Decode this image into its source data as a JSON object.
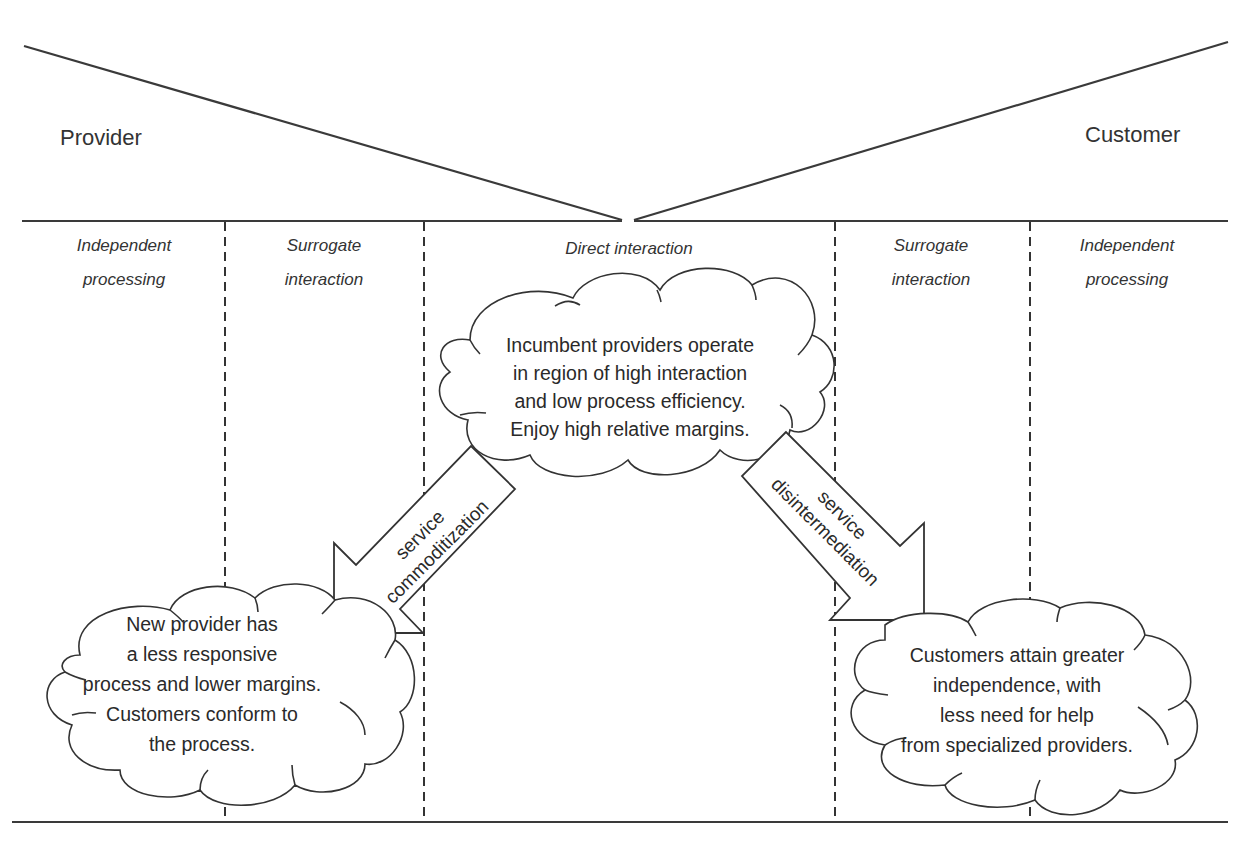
{
  "parties": {
    "provider": "Provider",
    "customer": "Customer"
  },
  "regions": [
    {
      "line1": "Independent",
      "line2": "processing"
    },
    {
      "line1": "Surrogate",
      "line2": "interaction"
    },
    {
      "line1": "Direct interaction",
      "line2": ""
    },
    {
      "line1": "Surrogate",
      "line2": "interaction"
    },
    {
      "line1": "Independent",
      "line2": "processing"
    }
  ],
  "clouds": {
    "incumbent": {
      "lines": [
        "Incumbent providers operate",
        "in region of high interaction",
        "and low process efficiency.",
        "Enjoy high relative margins."
      ]
    },
    "new_provider": {
      "lines": [
        "New provider has",
        "a less responsive",
        "process and lower margins.",
        "Customers conform to",
        "the process."
      ]
    },
    "customers": {
      "lines": [
        "Customers attain greater",
        "independence, with",
        "less need for help",
        "from specialized providers."
      ]
    }
  },
  "arrows": {
    "commoditization": {
      "line1": "service",
      "line2": "commoditization"
    },
    "disintermediation": {
      "line1": "service",
      "line2": "disintermediation"
    }
  }
}
